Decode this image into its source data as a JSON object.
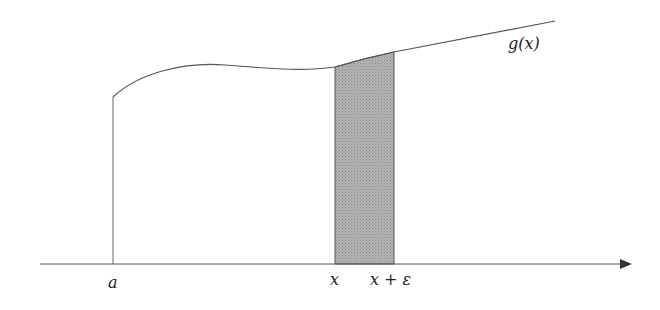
{
  "figure": {
    "function_label": "g(x)",
    "tick_labels": {
      "a": "a",
      "x": "x",
      "x_plus_eps": "x + ε"
    },
    "colors": {
      "line": "#555555",
      "shade": "#a8a8a8",
      "background": "#ffffff"
    }
  }
}
